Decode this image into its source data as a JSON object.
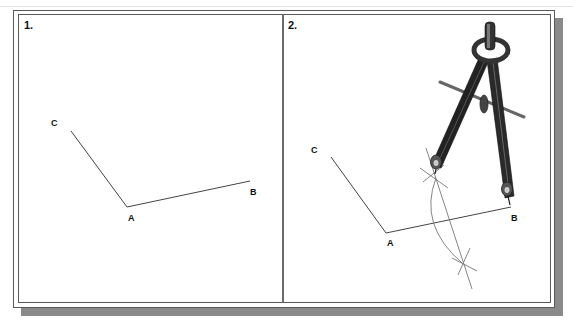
{
  "panels": [
    {
      "label": "1.",
      "points": {
        "A": "A",
        "B": "B",
        "C": "C"
      }
    },
    {
      "label": "2.",
      "points": {
        "A": "A",
        "B": "B",
        "C": "C"
      },
      "tool": "compass"
    }
  ],
  "colors": {
    "frame": "#5a5a5a",
    "shadow": "#8a8a8a",
    "line": "#444444",
    "construction": "#777777",
    "compass_dark": "#2a2a2a",
    "compass_mid": "#555555"
  }
}
